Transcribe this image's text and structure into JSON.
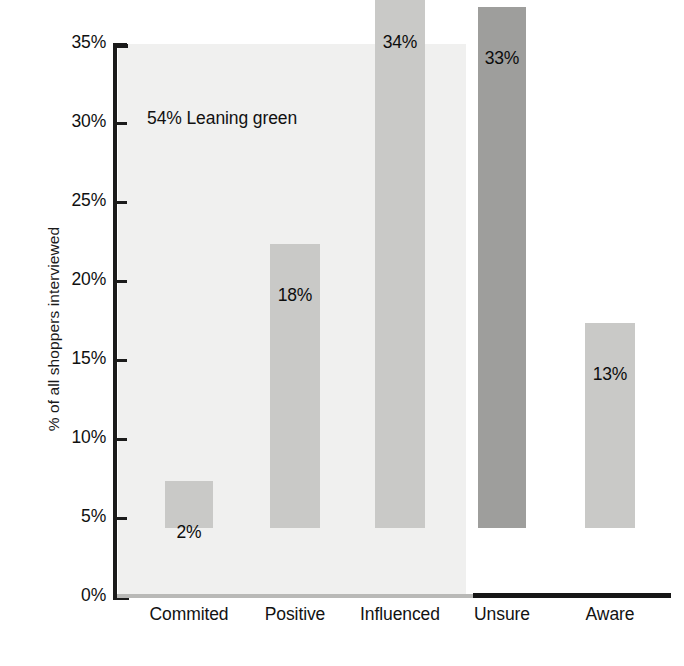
{
  "chart_data": {
    "type": "bar",
    "title": "",
    "xlabel": "",
    "ylabel": "% of all shoppers interviewed",
    "categories": [
      "Commited",
      "Positive",
      "Influenced",
      "Unsure",
      "Aware"
    ],
    "values": [
      2,
      18,
      34,
      33,
      13
    ],
    "value_labels": [
      "2%",
      "18%",
      "34%",
      "33%",
      "13%"
    ],
    "series": [
      {
        "name": "% of all shoppers interviewed",
        "values": [
          2,
          18,
          34,
          33,
          13
        ]
      }
    ],
    "ylim": [
      0,
      35
    ],
    "ytick_values": [
      0,
      5,
      10,
      15,
      20,
      25,
      30,
      35
    ],
    "ytick_labels": [
      "0%",
      "5%",
      "10%",
      "15%",
      "20%",
      "25%",
      "30%",
      "35%"
    ],
    "grid": false,
    "legend": null,
    "legend_position": "none",
    "annotations": [
      {
        "text": "54% Leaning green",
        "x_category_span": [
          "Commited",
          "Influenced"
        ],
        "y_value": 30
      }
    ],
    "groups": [
      {
        "name": "54% Leaning green",
        "categories": [
          "Commited",
          "Positive",
          "Influenced"
        ],
        "shaded_background": true,
        "bar_color": "#c9c9c7"
      },
      {
        "name": "",
        "categories": [
          "Unsure",
          "Aware"
        ],
        "shaded_background": false,
        "bar_colors": [
          "#9e9e9c",
          "#c9c9c7"
        ]
      }
    ],
    "colors": {
      "bar_light": "#c9c9c7",
      "bar_dark": "#9e9e9c",
      "plot_shade": "#f0f0ef",
      "axis": "#1b1b1b",
      "baseline_left": "#b9b9b7",
      "baseline_right": "#161616",
      "text": "#111111",
      "background": "#ffffff"
    }
  },
  "axis": {
    "ticks": [
      {
        "label": "35%",
        "value": 35
      },
      {
        "label": "30%",
        "value": 30
      },
      {
        "label": "25%",
        "value": 25
      },
      {
        "label": "20%",
        "value": 20
      },
      {
        "label": "15%",
        "value": 15
      },
      {
        "label": "10%",
        "value": 10
      },
      {
        "label": "5%",
        "value": 5
      },
      {
        "label": "0%",
        "value": 0
      }
    ],
    "y_title": "% of all shoppers interviewed"
  },
  "bars": [
    {
      "category": "Commited",
      "label": "2%",
      "value": 2
    },
    {
      "category": "Positive",
      "label": "18%",
      "value": 18
    },
    {
      "category": "Influenced",
      "label": "34%",
      "value": 34
    },
    {
      "category": "Unsure",
      "label": "33%",
      "value": 33
    },
    {
      "category": "Aware",
      "label": "13%",
      "value": 13
    }
  ],
  "annotation": {
    "text": "54% Leaning green"
  }
}
